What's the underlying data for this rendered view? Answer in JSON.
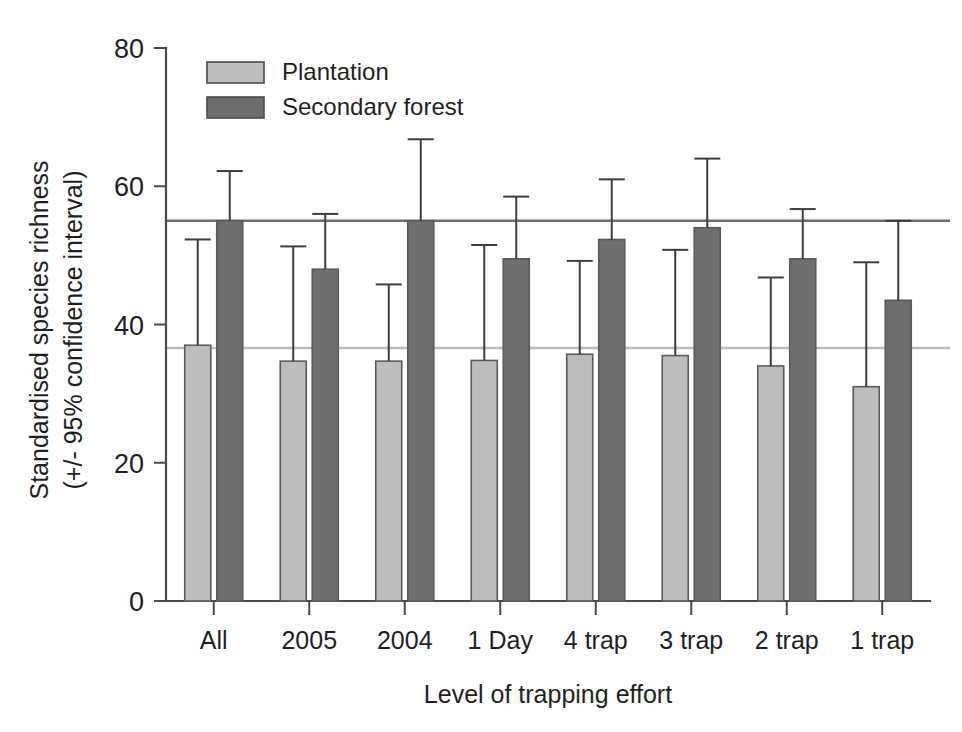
{
  "chart_data": {
    "type": "bar",
    "title": "",
    "xlabel": "Level of trapping effort",
    "ylabel": "Standardised species richness\n(+/- 95% confidence interval)",
    "ylabel_line1": "Standardised species richness",
    "ylabel_line2": "(+/- 95% confidence interval)",
    "categories": [
      "All",
      "2005",
      "2004",
      "1 Day",
      "4 trap",
      "3 trap",
      "2 trap",
      "1 trap"
    ],
    "ylim": [
      0,
      80
    ],
    "yticks": [
      0,
      20,
      40,
      60,
      80
    ],
    "ytick_labels": [
      "0",
      "20",
      "40",
      "60",
      "80"
    ],
    "grid": false,
    "legend_position": "top-left-inside",
    "error_bars": "upper 95% confidence interval only",
    "series": [
      {
        "name": "Plantation",
        "color": "#bdbdbd",
        "values": [
          37.0,
          34.7,
          34.7,
          34.8,
          35.7,
          35.5,
          34.0,
          31.0
        ],
        "errors_upper": [
          52.3,
          51.3,
          45.8,
          51.5,
          49.2,
          50.8,
          46.8,
          49.0
        ]
      },
      {
        "name": "Secondary forest",
        "color": "#6e6e6e",
        "values": [
          55.0,
          48.0,
          55.0,
          49.5,
          52.3,
          54.0,
          49.5,
          43.5
        ],
        "errors_upper": [
          62.2,
          56.0,
          66.8,
          58.5,
          61.0,
          64.0,
          56.7,
          55.0
        ]
      }
    ],
    "reference_lines": [
      {
        "name": "secondary-forest-reference",
        "value": 55.0,
        "color": "#6e6e6e"
      },
      {
        "name": "plantation-reference",
        "value": 36.6,
        "color": "#bdbdbd"
      }
    ]
  },
  "legend": {
    "entries": [
      {
        "label": "Plantation",
        "color": "#bdbdbd"
      },
      {
        "label": "Secondary forest",
        "color": "#6e6e6e"
      }
    ]
  },
  "axes": {
    "x_title": "Level of trapping effort",
    "y_title_line1": "Standardised species richness",
    "y_title_line2": "(+/- 95% confidence interval)"
  },
  "colors": {
    "plantation": "#bdbdbd",
    "secondary_forest": "#6e6e6e",
    "axis": "#4a4a4a",
    "text": "#1f1f1f",
    "background": "#ffffff"
  }
}
